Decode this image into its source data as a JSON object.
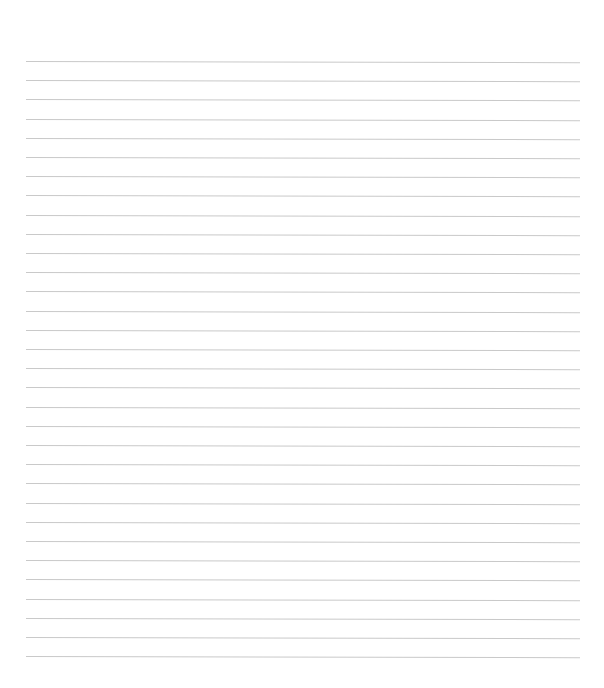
{
  "page": {
    "type": "ruled-paper",
    "background_color": "#ffffff",
    "line_color": "#c9c9c9",
    "line_count": 32,
    "first_line_y": 61,
    "line_spacing": 19.2,
    "line_left": 26,
    "line_width": 554,
    "text": ""
  }
}
